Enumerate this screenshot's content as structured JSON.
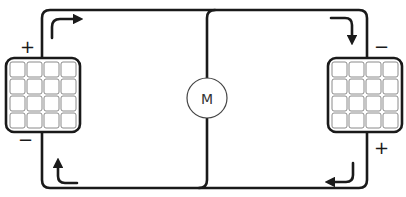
{
  "diagram": {
    "type": "circuit",
    "motor": {
      "label": "M",
      "cx": 207,
      "cy": 98,
      "r": 20
    },
    "panels": [
      {
        "id": "left",
        "x": 6,
        "y": 58,
        "w": 74,
        "h": 74,
        "rows": 4,
        "cols": 4,
        "terminals": {
          "top": "+",
          "bottom": "−"
        }
      },
      {
        "id": "right",
        "x": 328,
        "y": 58,
        "w": 74,
        "h": 74,
        "rows": 4,
        "cols": 4,
        "terminals": {
          "top": "−",
          "bottom": "+"
        }
      }
    ],
    "labels": {
      "left_top": "+",
      "left_bottom": "−",
      "right_top": "−",
      "right_bottom": "+"
    },
    "arrows": [
      {
        "position": "top-left",
        "direction": "up-then-right"
      },
      {
        "position": "top-right",
        "direction": "right-then-down"
      },
      {
        "position": "bottom-right",
        "direction": "down-then-left"
      },
      {
        "position": "bottom-left",
        "direction": "left-then-up"
      }
    ],
    "colors": {
      "wire": "#1a1a1a",
      "panel_border": "#1a1a1a",
      "cell_border": "#7a7a7a",
      "motor_border": "#333333",
      "background": "#ffffff"
    }
  }
}
